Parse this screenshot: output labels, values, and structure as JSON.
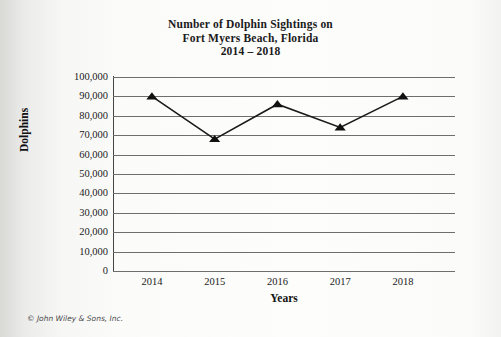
{
  "credit": "© John Wiley & Sons, Inc.",
  "chart_data": {
    "type": "line",
    "title": "Number of Dolphin Sightings on Fort Myers Beach, Florida 2014 – 2018",
    "title_lines": [
      "Number of Dolphin Sightings on",
      "Fort Myers Beach, Florida",
      "2014 – 2018"
    ],
    "xlabel": "Years",
    "ylabel": "Dolphins",
    "categories": [
      "2014",
      "2015",
      "2016",
      "2017",
      "2018"
    ],
    "values": [
      90000,
      68000,
      86000,
      74000,
      90000
    ],
    "ylim": [
      0,
      100000
    ],
    "ytick_values": [
      100000,
      90000,
      80000,
      70000,
      60000,
      50000,
      40000,
      30000,
      20000,
      10000,
      0
    ],
    "ytick_labels": [
      "100,000",
      "90,000",
      "80,000",
      "70,000",
      "60,000",
      "50,000",
      "40,000",
      "30,000",
      "20,000",
      "10,000",
      "0"
    ],
    "grid": true,
    "legend": "none",
    "marker": "triangle",
    "line_color": "#1a1a1a",
    "marker_color": "#111111",
    "grid_color": "#6e6e6e",
    "plot_background": "#ffffff"
  }
}
